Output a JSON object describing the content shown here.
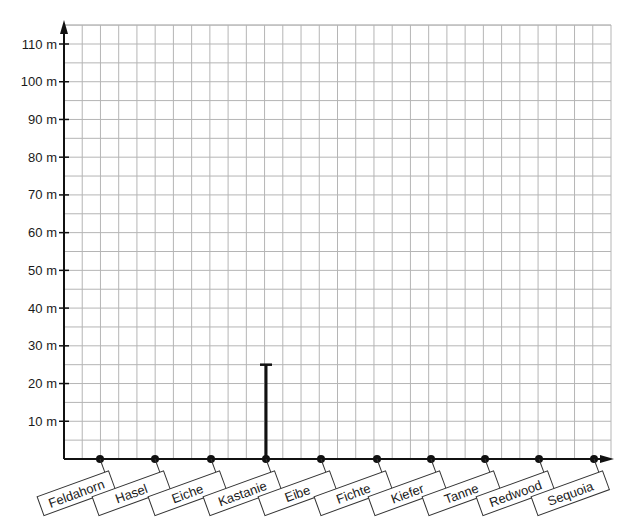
{
  "chart_data": {
    "type": "bar",
    "title": "",
    "xlabel": "",
    "ylabel": "",
    "ylim": [
      0,
      110
    ],
    "y_ticks": [
      10,
      20,
      30,
      40,
      50,
      60,
      70,
      80,
      90,
      100,
      110
    ],
    "y_tick_labels": [
      "10 m",
      "20 m",
      "30 m",
      "40 m",
      "50 m",
      "60 m",
      "70 m",
      "80 m",
      "90 m",
      "100 m",
      "110 m"
    ],
    "y_unit": "m",
    "grid": true,
    "grid_minor_step_y": 5,
    "categories": [
      "Feldahorn",
      "Hasel",
      "Eiche",
      "Kastanie",
      "Eibe",
      "Fichte",
      "Kiefer",
      "Tanne",
      "Redwood",
      "Sequoia"
    ],
    "values": [
      null,
      null,
      null,
      25,
      null,
      null,
      null,
      null,
      null,
      null
    ],
    "annotations": [
      "Only Kastanie has a bar drawn (25 m); other categories shown as dots on the x-axis"
    ],
    "legend": null
  },
  "colors": {
    "grid": "#b5b5b5",
    "axis": "#111111",
    "bar": "#111111",
    "label_border": "#333333"
  }
}
